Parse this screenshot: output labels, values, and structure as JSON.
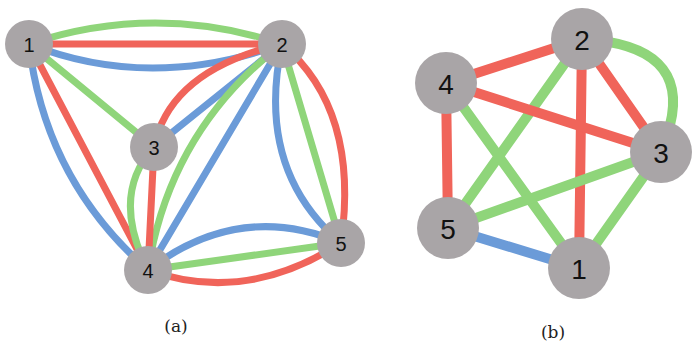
{
  "colors": {
    "red": "#f0645a",
    "green": "#8fd57a",
    "blue": "#6b9bd8",
    "node": "#a9a5a7",
    "background": "#ffffff"
  },
  "graph_a": {
    "caption": "(a)",
    "node_radius": 24,
    "nodes": [
      {
        "id": "1",
        "label": "1",
        "x": 29,
        "y": 44
      },
      {
        "id": "2",
        "label": "2",
        "x": 282,
        "y": 44
      },
      {
        "id": "3",
        "label": "3",
        "x": 154,
        "y": 147
      },
      {
        "id": "4",
        "label": "4",
        "x": 148,
        "y": 270
      },
      {
        "id": "5",
        "label": "5",
        "x": 341,
        "y": 243
      }
    ],
    "edges": [
      {
        "from": "1",
        "to": "2",
        "color": "green",
        "path": "M29,44 Q155,2 282,44"
      },
      {
        "from": "1",
        "to": "2",
        "color": "red",
        "path": "M29,44 L282,44"
      },
      {
        "from": "1",
        "to": "2",
        "color": "blue",
        "path": "M29,44 Q150,92 282,44"
      },
      {
        "from": "1",
        "to": "3",
        "color": "green",
        "path": "M29,44 L154,147"
      },
      {
        "from": "1",
        "to": "4",
        "color": "red",
        "path": "M29,44 L148,270"
      },
      {
        "from": "1",
        "to": "4",
        "color": "blue",
        "path": "M29,44 Q45,180 148,270"
      },
      {
        "from": "2",
        "to": "3",
        "color": "red",
        "path": "M282,44 Q170,70 154,147"
      },
      {
        "from": "2",
        "to": "3",
        "color": "blue",
        "path": "M282,44 L154,147"
      },
      {
        "from": "2",
        "to": "4",
        "color": "green",
        "path": "M282,44 Q170,130 148,270"
      },
      {
        "from": "2",
        "to": "4",
        "color": "blue",
        "path": "M282,44 L148,270"
      },
      {
        "from": "2",
        "to": "5",
        "color": "blue",
        "path": "M282,44 Q255,170 341,243"
      },
      {
        "from": "2",
        "to": "5",
        "color": "green",
        "path": "M282,44 L341,243"
      },
      {
        "from": "2",
        "to": "5",
        "color": "red",
        "path": "M282,44 Q360,110 341,243"
      },
      {
        "from": "3",
        "to": "4",
        "color": "red",
        "path": "M154,147 L148,270"
      },
      {
        "from": "3",
        "to": "4",
        "color": "green",
        "path": "M154,147 Q110,195 148,270"
      },
      {
        "from": "4",
        "to": "5",
        "color": "blue",
        "path": "M148,270 Q240,200 341,243"
      },
      {
        "from": "4",
        "to": "5",
        "color": "green",
        "path": "M148,270 L341,243"
      },
      {
        "from": "4",
        "to": "5",
        "color": "red",
        "path": "M148,270 Q245,305 341,243"
      }
    ]
  },
  "graph_b": {
    "caption": "(b)",
    "node_radius": 31,
    "nodes": [
      {
        "id": "1",
        "label": "1",
        "x": 579,
        "y": 268
      },
      {
        "id": "2",
        "label": "2",
        "x": 582,
        "y": 39
      },
      {
        "id": "3",
        "label": "3",
        "x": 661,
        "y": 152
      },
      {
        "id": "4",
        "label": "4",
        "x": 446,
        "y": 83
      },
      {
        "id": "5",
        "label": "5",
        "x": 448,
        "y": 228
      }
    ],
    "edges": [
      {
        "from": "2",
        "to": "4",
        "color": "red",
        "path": "M582,39 L446,83"
      },
      {
        "from": "2",
        "to": "3",
        "color": "red",
        "path": "M582,39 L661,152"
      },
      {
        "from": "2",
        "to": "3",
        "color": "green",
        "path": "M582,39 Q690,45 670,125"
      },
      {
        "from": "2",
        "to": "1",
        "color": "red",
        "path": "M582,39 L579,268"
      },
      {
        "from": "2",
        "to": "5",
        "color": "green",
        "path": "M582,39 L448,228"
      },
      {
        "from": "4",
        "to": "3",
        "color": "red",
        "path": "M446,83 L661,152"
      },
      {
        "from": "4",
        "to": "5",
        "color": "red",
        "path": "M446,83 L448,228"
      },
      {
        "from": "4",
        "to": "1",
        "color": "green",
        "path": "M446,83 L579,268"
      },
      {
        "from": "3",
        "to": "5",
        "color": "green",
        "path": "M661,152 L448,228"
      },
      {
        "from": "3",
        "to": "1",
        "color": "green",
        "path": "M661,152 L579,268"
      },
      {
        "from": "5",
        "to": "1",
        "color": "blue",
        "path": "M448,228 L579,268"
      }
    ]
  }
}
